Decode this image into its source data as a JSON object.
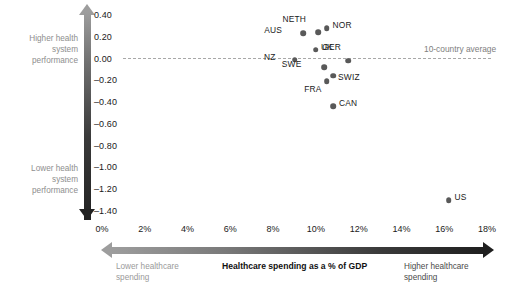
{
  "chart_data": {
    "type": "scatter",
    "title": "",
    "xlabel": "Healthcare spending as a % of GDP",
    "ylabel": "Health system performance",
    "xlim": [
      0,
      18
    ],
    "ylim": [
      -1.4,
      0.4
    ],
    "grid": false,
    "legend": "none",
    "reference_line": {
      "y": 0.0,
      "label": "10-country average"
    },
    "x_ticks": [
      "0%",
      "2%",
      "4%",
      "6%",
      "8%",
      "10%",
      "12%",
      "14%",
      "16%",
      "18%"
    ],
    "x_tick_values": [
      0,
      2,
      4,
      6,
      8,
      10,
      12,
      14,
      16,
      18
    ],
    "y_ticks": [
      "0.40",
      "0.20",
      "0.00",
      "-0.20",
      "-0.40",
      "-0.60",
      "-0.80",
      "-1.00",
      "-1.20",
      "-1.40"
    ],
    "y_tick_values": [
      0.4,
      0.2,
      0.0,
      -0.2,
      -0.4,
      -0.6,
      -0.8,
      -1.0,
      -1.2,
      -1.4
    ],
    "points": [
      {
        "label": "AUS",
        "x": 9.4,
        "y": 0.24,
        "label_dx": -21,
        "label_dy": -4
      },
      {
        "label": "NETH",
        "x": 10.1,
        "y": 0.25,
        "label_dx": -12,
        "label_dy": -14
      },
      {
        "label": "NOR",
        "x": 10.5,
        "y": 0.29,
        "label_dx": 6,
        "label_dy": -4
      },
      {
        "label": "UK",
        "x": 10.0,
        "y": 0.09,
        "label_dx": 5,
        "label_dy": -4
      },
      {
        "label": "GER",
        "x": 11.5,
        "y": -0.01,
        "label_dx": -7,
        "label_dy": -15
      },
      {
        "label": "NZ",
        "x": 9.0,
        "y": 0.0,
        "label_dx": -19,
        "label_dy": -4
      },
      {
        "label": "SWE",
        "x": 10.4,
        "y": -0.07,
        "label_dx": -23,
        "label_dy": -4
      },
      {
        "label": "SWIZ",
        "x": 10.8,
        "y": -0.15,
        "label_dx": 5,
        "label_dy": 0
      },
      {
        "label": "FRA",
        "x": 10.5,
        "y": -0.2,
        "label_dx": -5,
        "label_dy": 7
      },
      {
        "label": "CAN",
        "x": 10.8,
        "y": -0.43,
        "label_dx": 6,
        "label_dy": -4
      },
      {
        "label": "US",
        "x": 16.2,
        "y": -1.29,
        "label_dx": 6,
        "label_dy": -4
      }
    ]
  },
  "annotations": {
    "higher_performance": "Higher health\nsystem\nperformance",
    "lower_performance": "Lower health\nsystem\nperformance",
    "lower_spending": "Lower healthcare\nspending",
    "higher_spending": "Higher healthcare\nspending",
    "x_axis_title": "Healthcare spending as a % of GDP",
    "average_line_label": "10-country average"
  },
  "colors": {
    "point": "#595959",
    "reference_line": "#a8a8a8",
    "axis_dark": "#1f1f1f",
    "axis_light": "#9d9d9d",
    "muted_text": "#8e8e8e"
  }
}
